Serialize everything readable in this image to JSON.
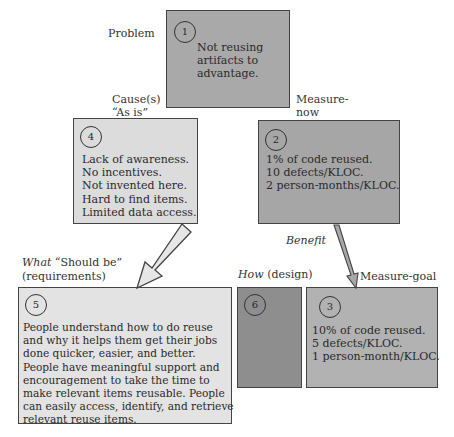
{
  "labels": {
    "problem": "Problem",
    "cause_line1": "Cause(s)",
    "cause_line2": "“As is”",
    "measure_now_line1": "Measure-",
    "measure_now_line2": "now",
    "benefit": "Benefit",
    "what_italic": "What",
    "what_rest": " “Should be”",
    "what_line2": "(requirements)",
    "how_italic": "How",
    "how_rest": " (design)",
    "measure_goal": "Measure-goal"
  },
  "boxes": {
    "problem": {
      "number": "1",
      "lines": [
        "Not reusing",
        "artifacts to",
        "advantage."
      ],
      "fill": "#a9a9a9"
    },
    "cause": {
      "number": "4",
      "lines": [
        "Lack of awareness.",
        "No incentives.",
        "Not invented here.",
        "Hard to find items.",
        "Limited data access."
      ],
      "fill": "#dcdcdc"
    },
    "measure_now": {
      "number": "2",
      "lines": [
        "1% of code reused.",
        "10 defects/KLOC.",
        "2 person-months/KLOC."
      ],
      "fill": "#a6a6a6"
    },
    "should_be": {
      "number": "5",
      "lines": [
        "People understand how to do reuse",
        "and why it helps them get their jobs",
        "done quicker, easier, and better.",
        "People have meaningful support and",
        "encouragement to take the time to",
        "make relevant items reusable. People",
        "can easily access, identify, and retrieve",
        "relevant reuse items."
      ],
      "fill": "#e3e3e3"
    },
    "design": {
      "number": "6",
      "lines": [],
      "fill": "#8e8e8e"
    },
    "measure_goal": {
      "number": "3",
      "lines": [
        "10% of code reused.",
        "5 defects/KLOC.",
        "1 person-month/KLOC."
      ],
      "fill": "#b2b2b2"
    }
  }
}
